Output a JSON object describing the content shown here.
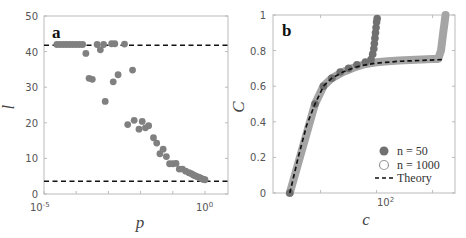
{
  "chart_data": [
    {
      "panel": "a",
      "type": "scatter",
      "xlabel": "p",
      "ylabel": "l",
      "xscale": "log",
      "xlim": [
        1e-05,
        1
      ],
      "ylim": [
        0,
        50
      ],
      "xticks": [
        "10^-5",
        "10^0"
      ],
      "yticks": [
        0,
        10,
        20,
        30,
        40,
        50
      ],
      "grid": false,
      "series": [
        {
          "name": "simulation",
          "marker": "filled-circle",
          "color": "#808080",
          "points_log10p_l": [
            [
              -4.6,
              42
            ],
            [
              -4.5,
              42
            ],
            [
              -4.4,
              42
            ],
            [
              -4.3,
              42
            ],
            [
              -4.2,
              42
            ],
            [
              -4.1,
              42
            ],
            [
              -4.0,
              42
            ],
            [
              -3.9,
              42
            ],
            [
              -3.8,
              42
            ],
            [
              -3.7,
              39.5
            ],
            [
              -3.6,
              32.5
            ],
            [
              -3.5,
              32.2
            ],
            [
              -3.35,
              42
            ],
            [
              -3.25,
              40.5
            ],
            [
              -3.1,
              26
            ],
            [
              -3.15,
              42
            ],
            [
              -2.9,
              42.2
            ],
            [
              -2.8,
              42.2
            ],
            [
              -2.85,
              31.5
            ],
            [
              -2.7,
              33.5
            ],
            [
              -2.5,
              42.1
            ],
            [
              -2.4,
              19.5
            ],
            [
              -2.25,
              34.8
            ],
            [
              -2.2,
              20.7
            ],
            [
              -2.05,
              18.2
            ],
            [
              -1.95,
              20.4
            ],
            [
              -1.85,
              18.6
            ],
            [
              -1.75,
              19.2
            ],
            [
              -1.6,
              15.8
            ],
            [
              -1.5,
              14.3
            ],
            [
              -1.4,
              11.3
            ],
            [
              -1.3,
              12.6
            ],
            [
              -1.2,
              10.5
            ],
            [
              -1.1,
              8.5
            ],
            [
              -1.0,
              8.5
            ],
            [
              -0.9,
              8.6
            ],
            [
              -0.8,
              7
            ],
            [
              -0.7,
              7
            ],
            [
              -0.6,
              6.4
            ],
            [
              -0.5,
              6
            ],
            [
              -0.45,
              5.8
            ],
            [
              -0.4,
              5.6
            ],
            [
              -0.35,
              5.3
            ],
            [
              -0.3,
              5.1
            ],
            [
              -0.25,
              4.9
            ],
            [
              -0.2,
              4.7
            ],
            [
              -0.15,
              4.5
            ],
            [
              -0.1,
              4.3
            ],
            [
              -0.05,
              4.1
            ],
            [
              0,
              4
            ]
          ]
        }
      ],
      "reference_lines": [
        {
          "style": "dashed",
          "color": "#111111",
          "y": 41.8
        },
        {
          "style": "dashed",
          "color": "#111111",
          "y": 3.6
        }
      ]
    },
    {
      "panel": "b",
      "type": "scatter",
      "xlabel": "c",
      "ylabel": "C",
      "xscale": "log",
      "ylim": [
        0,
        1
      ],
      "xticks": [
        "10^2"
      ],
      "yticks": [
        0,
        0.2,
        0.4,
        0.6,
        0.8,
        1
      ],
      "grid": false,
      "legend": {
        "position": "lower right",
        "entries": [
          "n = 50",
          "n = 1000",
          "Theory"
        ]
      },
      "series": [
        {
          "name": "n = 50",
          "marker": "filled-circle",
          "color": "#707070",
          "points_log10c_C": [
            [
              0.45,
              0
            ],
            [
              0.9,
              0.5
            ],
            [
              1.05,
              0.6
            ],
            [
              1.2,
              0.645
            ],
            [
              1.35,
              0.68
            ],
            [
              1.5,
              0.7
            ],
            [
              1.65,
              0.72
            ],
            [
              1.8,
              0.735
            ],
            [
              1.9,
              0.75
            ],
            [
              1.93,
              0.78
            ],
            [
              1.95,
              0.81
            ],
            [
              1.96,
              0.84
            ],
            [
              1.97,
              0.87
            ],
            [
              1.98,
              0.9
            ],
            [
              1.99,
              0.93
            ],
            [
              2.0,
              0.96
            ],
            [
              2.01,
              0.98
            ]
          ]
        },
        {
          "name": "n = 1000",
          "marker": "open-circle",
          "color": "#a0a0a0",
          "points_log10c_C": [
            [
              0.45,
              0
            ],
            [
              0.9,
              0.5
            ],
            [
              1.05,
              0.6
            ],
            [
              1.2,
              0.645
            ],
            [
              1.4,
              0.68
            ],
            [
              1.6,
              0.705
            ],
            [
              1.8,
              0.725
            ],
            [
              2.0,
              0.735
            ],
            [
              2.2,
              0.74
            ],
            [
              2.4,
              0.745
            ],
            [
              2.6,
              0.748
            ],
            [
              2.8,
              0.75
            ],
            [
              3.0,
              0.752
            ],
            [
              3.1,
              0.753
            ],
            [
              3.15,
              0.8
            ],
            [
              3.17,
              0.85
            ],
            [
              3.19,
              0.9
            ],
            [
              3.21,
              0.95
            ],
            [
              3.23,
              1.0
            ]
          ]
        },
        {
          "name": "Theory",
          "style": "dashed",
          "color": "#111111",
          "points_log10c_C": [
            [
              0.45,
              0
            ],
            [
              0.6,
              0.2
            ],
            [
              0.75,
              0.38
            ],
            [
              0.9,
              0.5
            ],
            [
              1.05,
              0.6
            ],
            [
              1.2,
              0.645
            ],
            [
              1.4,
              0.68
            ],
            [
              1.6,
              0.705
            ],
            [
              1.8,
              0.72
            ],
            [
              2.0,
              0.73
            ],
            [
              2.4,
              0.74
            ],
            [
              2.8,
              0.745
            ],
            [
              3.2,
              0.75
            ]
          ]
        }
      ],
      "xlim_log10": [
        0.15,
        3.4
      ]
    }
  ],
  "labels": {
    "panel_a": "a",
    "panel_b": "b",
    "a_xlabel": "p",
    "a_ylabel": "l",
    "b_xlabel": "c",
    "b_ylabel": "C",
    "a_yticks": [
      "0",
      "10",
      "20",
      "30",
      "40",
      "50"
    ],
    "b_yticks": [
      "0",
      "0.2",
      "0.4",
      "0.6",
      "0.8",
      "1"
    ],
    "legend_n50": "n = 50",
    "legend_n1000": "n = 1000",
    "legend_theory": "Theory"
  }
}
